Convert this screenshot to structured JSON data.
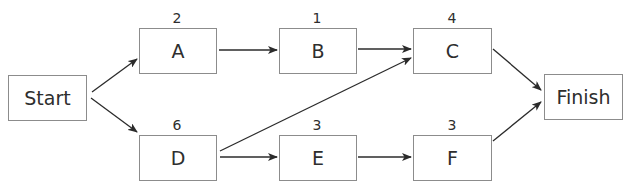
{
  "diagram": {
    "type": "activity-on-node network",
    "nodes": [
      {
        "id": "start",
        "label": "Start",
        "duration": null
      },
      {
        "id": "a",
        "label": "A",
        "duration": "2"
      },
      {
        "id": "b",
        "label": "B",
        "duration": "1"
      },
      {
        "id": "c",
        "label": "C",
        "duration": "4"
      },
      {
        "id": "d",
        "label": "D",
        "duration": "6"
      },
      {
        "id": "e",
        "label": "E",
        "duration": "3"
      },
      {
        "id": "f",
        "label": "F",
        "duration": "3"
      },
      {
        "id": "finish",
        "label": "Finish",
        "duration": null
      }
    ],
    "edges": [
      {
        "from": "Start",
        "to": "A"
      },
      {
        "from": "Start",
        "to": "D"
      },
      {
        "from": "A",
        "to": "B"
      },
      {
        "from": "B",
        "to": "C"
      },
      {
        "from": "D",
        "to": "C"
      },
      {
        "from": "D",
        "to": "E"
      },
      {
        "from": "E",
        "to": "F"
      },
      {
        "from": "C",
        "to": "Finish"
      },
      {
        "from": "F",
        "to": "Finish"
      }
    ]
  }
}
